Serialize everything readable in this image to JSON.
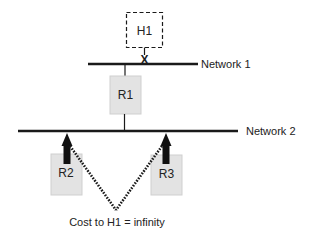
{
  "diagram": {
    "type": "network-topology",
    "colors": {
      "line": "#1a1a1a",
      "router_fill": "#e3e3e3",
      "router_stroke": "#c8c8c8",
      "text": "#222222",
      "background": "#ffffff"
    },
    "networks": [
      {
        "id": "network1",
        "label": "Network 1"
      },
      {
        "id": "network2",
        "label": "Network 2"
      }
    ],
    "hosts": [
      {
        "id": "H1",
        "label": "H1",
        "style": "dashed",
        "link_status": "broken"
      }
    ],
    "routers": [
      {
        "id": "R1",
        "label": "R1"
      },
      {
        "id": "R2",
        "label": "R2"
      },
      {
        "id": "R3",
        "label": "R3"
      }
    ],
    "link_break_marker": "X",
    "caption": "Cost to H1 = infinity"
  }
}
